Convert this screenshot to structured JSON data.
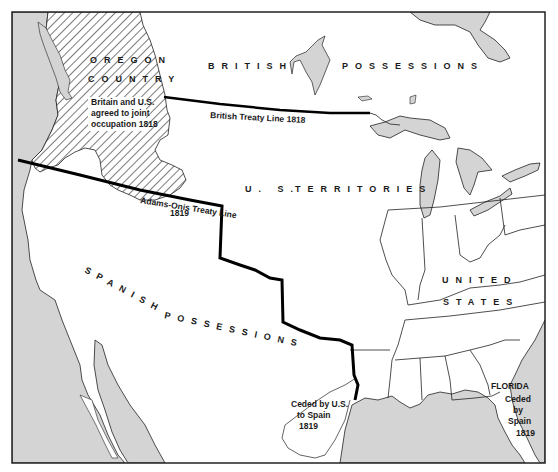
{
  "map": {
    "colors": {
      "water": "#d4d4d4",
      "land": "#ffffff",
      "border": "#222222",
      "treaty_line": "#000000",
      "hatch": "#333333"
    },
    "regions": {
      "british": "BRITISH POSSESSIONS",
      "british_word1": "BRITISH",
      "british_word2": "POSSESSIONS",
      "us_territories_word1": "U. S.",
      "us_territories_word2": "TERRITORIES",
      "spanish_word1": "SPANISH",
      "spanish_word2": "POSSESSIONS",
      "united_states_word1": "UNITED",
      "united_states_word2": "STATES",
      "oregon_word1": "OREGON",
      "oregon_word2": "COUNTRY"
    },
    "notes": {
      "oregon_line1": "Britain and U.S.",
      "oregon_line2": "agreed to joint",
      "oregon_line3": "occupation 1818",
      "british_treaty": "British Treaty Line 1818",
      "adams_onis_line1": "Adams-Onis Treaty Line",
      "adams_onis_line2": "1819",
      "ceded_us_line1": "Ceded by U.S.",
      "ceded_us_line2": "to Spain",
      "ceded_us_line3": "1819",
      "florida": "FLORIDA",
      "ceded_spain_line1": "Ceded",
      "ceded_spain_line2": "by",
      "ceded_spain_line3": "Spain",
      "ceded_spain_line4": "1819"
    }
  }
}
